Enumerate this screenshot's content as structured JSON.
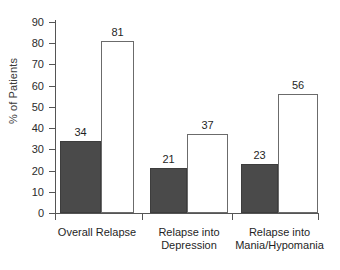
{
  "chart_data": {
    "type": "bar",
    "title": "",
    "xlabel": "",
    "ylabel": "% of Patients",
    "ylim": [
      0,
      90
    ],
    "ytick_step": 10,
    "yticks": [
      0,
      10,
      20,
      30,
      40,
      50,
      60,
      70,
      80,
      90
    ],
    "grid": false,
    "legend": null,
    "categories": [
      "Overall Relapse",
      "Relapse into Depression",
      "Relapse into Mania/Hypomania"
    ],
    "category_lines": [
      [
        "Overall Relapse"
      ],
      [
        "Relapse into",
        "Depression"
      ],
      [
        "Relapse into",
        "Mania/Hypomania"
      ]
    ],
    "series": [
      {
        "name": "dark",
        "values": [
          34,
          21,
          23
        ],
        "color": "#4a4a4a"
      },
      {
        "name": "light",
        "values": [
          81,
          37,
          56
        ],
        "color": "#ffffff"
      }
    ],
    "data_labels": [
      34,
      81,
      21,
      37,
      23,
      56
    ]
  },
  "axis": {
    "y_label": "% of Patients",
    "y_tick_labels": [
      "90",
      "80",
      "70",
      "60",
      "50",
      "40",
      "30",
      "20",
      "10",
      "0"
    ]
  }
}
